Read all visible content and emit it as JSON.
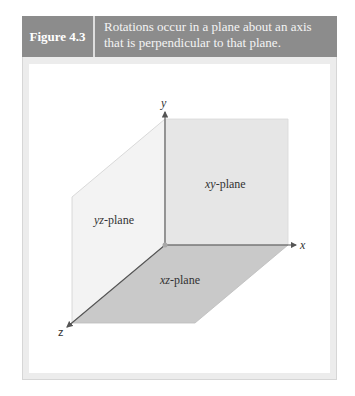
{
  "figure": {
    "label": "Figure 4.3",
    "caption_line1": "Rotations occur in a plane about an axis",
    "caption_line2": "that is perpendicular to that plane."
  },
  "diagram": {
    "axes": {
      "x": "x",
      "y": "y",
      "z": "z"
    },
    "planes": [
      {
        "id": "xy",
        "italic": "xy",
        "suffix": "-plane",
        "color": "#e6e6e6"
      },
      {
        "id": "yz",
        "italic": "yz",
        "suffix": "-plane",
        "color": "#f3f3f3"
      },
      {
        "id": "xz",
        "italic": "xz",
        "suffix": "-plane",
        "color": "#c9c9c9"
      }
    ],
    "colors": {
      "header": "#8c8c8c",
      "axis": "#555555",
      "frame": "#ececec"
    }
  }
}
